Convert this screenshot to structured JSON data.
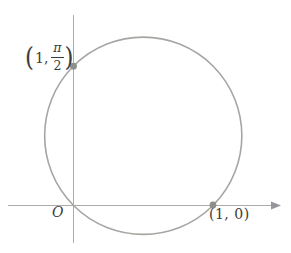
{
  "figure": {
    "colors": {
      "background": "#ffffff",
      "axis": "#ababa9",
      "arrowhead": "#96969a",
      "circle": "#a5a5a1",
      "dot": "#8e8e8c",
      "text": "#3c3c3a"
    }
  },
  "labels": {
    "origin": "O",
    "point_right": "(1, 0)",
    "point_top": {
      "open_paren": "(",
      "coord_first": "1,",
      "frac_numerator": "π",
      "frac_denominator": "2",
      "close_paren": ")"
    }
  }
}
